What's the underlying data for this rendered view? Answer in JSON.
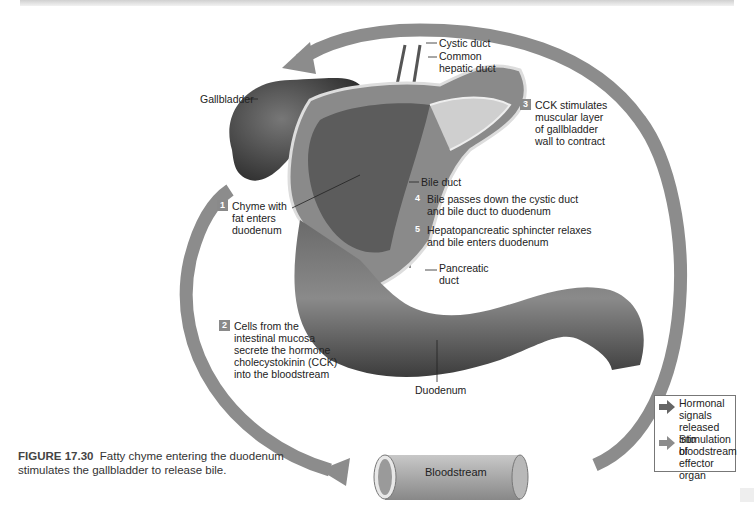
{
  "figure": {
    "number": "FIGURE 17.30",
    "caption": "Fatty chyme entering the duodenum stimulates the gallbladder to release bile."
  },
  "anatomy_labels": {
    "cystic_duct": "Cystic duct",
    "common_hepatic_duct": "Common\nhepatic duct",
    "gallbladder": "Gallbladder",
    "bile_duct": "Bile duct",
    "pancreatic_duct": "Pancreatic\nduct",
    "duodenum": "Duodenum",
    "bloodstream": "Bloodstream"
  },
  "steps": [
    {
      "num": "1",
      "text": "Chyme with\nfat enters\nduodenum"
    },
    {
      "num": "2",
      "text": "Cells from the\nintestinal mucosa\nsecrete the hormone\ncholecystokinin (CCK)\ninto the bloodstream"
    },
    {
      "num": "3",
      "text": "CCK stimulates\nmuscular layer\nof gallbladder\nwall to contract"
    },
    {
      "num": "4",
      "text": "Bile passes down the cystic duct\nand bile duct to duodenum"
    },
    {
      "num": "5",
      "text": "Hepatopancreatic sphincter relaxes\nand bile enters duodenum"
    }
  ],
  "legend": [
    {
      "icon": "dark-arrow-icon",
      "text": "Hormonal\nsignals released\ninto bloodstream"
    },
    {
      "icon": "light-arrow-icon",
      "text": "Stimulation of\neffector organ"
    }
  ],
  "colors": {
    "pathway_arrow": "#8c8c8c",
    "organ_dark": "#4a4a4a",
    "step_badge": "#8a8a8a"
  }
}
